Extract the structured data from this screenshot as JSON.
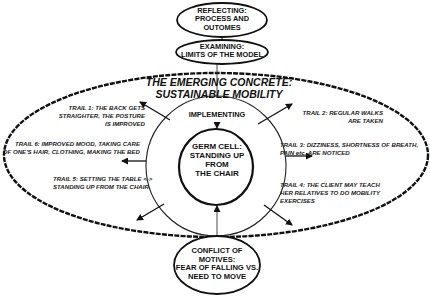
{
  "diagram": {
    "top_nodes": {
      "reflecting": "REFLECTING:\nPROCESS AND\nOUTOMES",
      "examining": "EXAMINING:\nLIMITS OF THE MODEL"
    },
    "outer_title": "THE EMERGING CONCRETE:\nSUSTAINABLE MOBILITY",
    "ring_label": "IMPLEMENTING",
    "germ_cell": "GERM CELL:\nSTANDING UP\nFROM\nTHE CHAIR",
    "conflict": "CONFLICT OF\nMOTIVES:\nFEAR OF FALLING VS.\nNEED TO MOVE",
    "trails": [
      {
        "id": 1,
        "text": "TRAIL 1: THE BACK GETS\nSTRAIGHTER, THE POSTURE\nIS IMPROVED"
      },
      {
        "id": 2,
        "text": "TRAIL 2: REGULAR WALKS\nARE TAKEN"
      },
      {
        "id": 3,
        "text": "TRAIL 3: DIZZINESS, SHORTNESS OF BREATH,\nPAIN etc. ARE NOTICED"
      },
      {
        "id": 4,
        "text": "TRAIL 4: THE CLIENT MAY TEACH\nHER  RELATIVES TO DO MOBILITY\nEXERCISES"
      },
      {
        "id": 5,
        "text": "TRAIL 5: SETTING THE TABLE <->\nSTANDING UP FROM THE CHAIR"
      },
      {
        "id": 6,
        "text": "TRAIL 6: IMPROVED MOOD, TAKING CARE\nOF ONE'S HAIR, CLOTHING, MAKING THE BED"
      }
    ],
    "colors": {
      "line": "#111111",
      "background": "#ffffff"
    }
  }
}
